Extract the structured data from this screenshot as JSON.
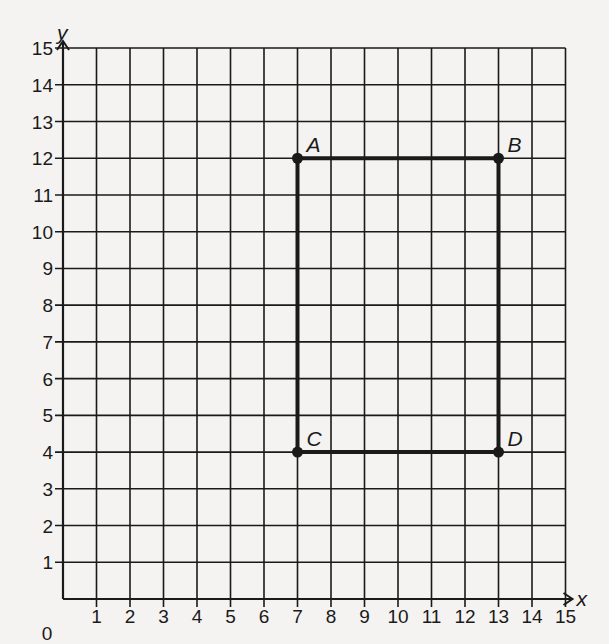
{
  "chart_data": {
    "type": "scatter",
    "title": "",
    "xlabel": "x",
    "ylabel": "y",
    "xlim": [
      0,
      15
    ],
    "ylim": [
      0,
      15
    ],
    "grid": true,
    "origin_label": "0",
    "x_ticks": [
      "1",
      "2",
      "3",
      "4",
      "5",
      "6",
      "7",
      "8",
      "9",
      "10",
      "11",
      "12",
      "13",
      "14",
      "15"
    ],
    "y_ticks": [
      "1",
      "2",
      "3",
      "4",
      "5",
      "6",
      "7",
      "8",
      "9",
      "10",
      "11",
      "12",
      "13",
      "14",
      "15"
    ],
    "points": [
      {
        "label": "A",
        "x": 7,
        "y": 12
      },
      {
        "label": "B",
        "x": 13,
        "y": 12
      },
      {
        "label": "C",
        "x": 7,
        "y": 4
      },
      {
        "label": "D",
        "x": 13,
        "y": 4
      }
    ],
    "polygon": {
      "name": "rectangle ABDC",
      "vertices": [
        "A",
        "B",
        "D",
        "C"
      ]
    }
  },
  "colors": {
    "ink": "#1a1a1a",
    "paper": "#f4f3f1"
  }
}
